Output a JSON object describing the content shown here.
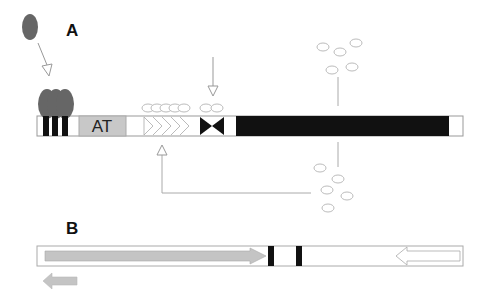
{
  "panel_a": {
    "label": "A",
    "box_label": "AT",
    "elements": [
      "protein-binding-sites",
      "AT-rich-region",
      "repeat-arrows",
      "inverted-repeat",
      "coding-region"
    ]
  },
  "panel_b": {
    "label": "B"
  },
  "colors": {
    "protein": "#666666",
    "at_box": "#c8c8c8",
    "black": "#111111",
    "line": "#999999",
    "arrow_fill": "#c4c4c4"
  }
}
